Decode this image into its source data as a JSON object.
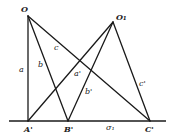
{
  "diagram": {
    "points": {
      "O": {
        "label": "O",
        "x": 28,
        "y": 16
      },
      "O1": {
        "label": "O₁",
        "x": 113,
        "y": 22
      },
      "A": {
        "label": "A'",
        "x": 28,
        "y": 121
      },
      "B": {
        "label": "B'",
        "x": 68,
        "y": 121
      },
      "C": {
        "label": "C'",
        "x": 150,
        "y": 121
      }
    },
    "segments": {
      "a": "a",
      "b": "b",
      "c": "c",
      "a_prime": "a'",
      "b_prime": "b'",
      "c_prime": "c'",
      "sigma1": "σ₁"
    },
    "baseline": {
      "x1": 9,
      "x2": 166,
      "y": 121
    }
  }
}
